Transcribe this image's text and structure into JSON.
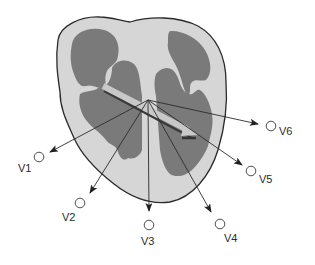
{
  "diagram": {
    "colors": {
      "background": "#ffffff",
      "myocardium": "#d6d6d6",
      "chambers": "#7a7a7a",
      "outline": "#2a2a2a",
      "lead_lines": "#2b2b2b",
      "axis_arrow": "#c8c8c8",
      "axis_arrow_shadow": "#3a3a3a"
    },
    "center": {
      "x": 148,
      "y": 100
    },
    "mean_axis_arrow": {
      "from": {
        "x": 103,
        "y": 86
      },
      "to": {
        "x": 196,
        "y": 134
      },
      "description": "mean electrical axis"
    },
    "leads": [
      {
        "id": "V1",
        "label": "V1",
        "arrow_end": {
          "x": 50,
          "y": 152
        },
        "electrode": {
          "x": 39,
          "y": 157
        },
        "label_pos": {
          "x": 18,
          "y": 172
        }
      },
      {
        "id": "V2",
        "label": "V2",
        "arrow_end": {
          "x": 90,
          "y": 193
        },
        "electrode": {
          "x": 80,
          "y": 203
        },
        "label_pos": {
          "x": 62,
          "y": 221
        }
      },
      {
        "id": "V3",
        "label": "V3",
        "arrow_end": {
          "x": 149,
          "y": 211
        },
        "electrode": {
          "x": 149,
          "y": 225
        },
        "label_pos": {
          "x": 141,
          "y": 245
        }
      },
      {
        "id": "V4",
        "label": "V4",
        "arrow_end": {
          "x": 211,
          "y": 212
        },
        "electrode": {
          "x": 220,
          "y": 224
        },
        "label_pos": {
          "x": 224,
          "y": 242
        }
      },
      {
        "id": "V5",
        "label": "V5",
        "arrow_end": {
          "x": 242,
          "y": 165
        },
        "electrode": {
          "x": 251,
          "y": 171
        },
        "label_pos": {
          "x": 259,
          "y": 183
        }
      },
      {
        "id": "V6",
        "label": "V6",
        "arrow_end": {
          "x": 258,
          "y": 124
        },
        "electrode": {
          "x": 271,
          "y": 126
        },
        "label_pos": {
          "x": 279,
          "y": 135
        }
      }
    ]
  }
}
